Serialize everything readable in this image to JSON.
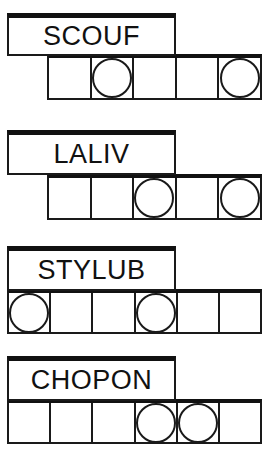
{
  "sheet": {
    "title": "word-scramble-worksheet",
    "ink_color": "#111111",
    "paper_color": "#ffffff",
    "circle_marker": "open-circle"
  },
  "rows": [
    {
      "id": "row-1",
      "word": "SCOUF",
      "cell_count": 5,
      "circled_cells": [
        2,
        5
      ],
      "cells": [
        {
          "index": 1,
          "letter": "",
          "circled": false
        },
        {
          "index": 2,
          "letter": "",
          "circled": true
        },
        {
          "index": 3,
          "letter": "",
          "circled": false
        },
        {
          "index": 4,
          "letter": "",
          "circled": false
        },
        {
          "index": 5,
          "letter": "",
          "circled": true
        }
      ]
    },
    {
      "id": "row-2",
      "word": "LALIV",
      "cell_count": 5,
      "circled_cells": [
        3,
        5
      ],
      "cells": [
        {
          "index": 1,
          "letter": "",
          "circled": false
        },
        {
          "index": 2,
          "letter": "",
          "circled": false
        },
        {
          "index": 3,
          "letter": "",
          "circled": true
        },
        {
          "index": 4,
          "letter": "",
          "circled": false
        },
        {
          "index": 5,
          "letter": "",
          "circled": true
        }
      ]
    },
    {
      "id": "row-3",
      "word": "STYLUB",
      "cell_count": 6,
      "circled_cells": [
        1,
        4
      ],
      "cells": [
        {
          "index": 1,
          "letter": "",
          "circled": true
        },
        {
          "index": 2,
          "letter": "",
          "circled": false
        },
        {
          "index": 3,
          "letter": "",
          "circled": false
        },
        {
          "index": 4,
          "letter": "",
          "circled": true
        },
        {
          "index": 5,
          "letter": "",
          "circled": false
        },
        {
          "index": 6,
          "letter": "",
          "circled": false
        }
      ]
    },
    {
      "id": "row-4",
      "word": "CHOPON",
      "cell_count": 6,
      "circled_cells": [
        4,
        5
      ],
      "cells": [
        {
          "index": 1,
          "letter": "",
          "circled": false
        },
        {
          "index": 2,
          "letter": "",
          "circled": false
        },
        {
          "index": 3,
          "letter": "",
          "circled": false
        },
        {
          "index": 4,
          "letter": "",
          "circled": true
        },
        {
          "index": 5,
          "letter": "",
          "circled": true
        },
        {
          "index": 6,
          "letter": "",
          "circled": false
        }
      ]
    }
  ]
}
